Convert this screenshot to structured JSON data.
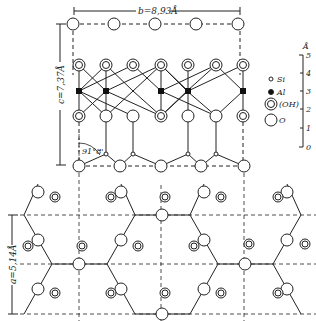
{
  "dimensions": {
    "b_label": "b=8,93Å",
    "c_label": "c=7,37Å",
    "a_label": "a=5,14Å",
    "angle_label": "91°8'"
  },
  "legend": {
    "items": [
      {
        "symbol": "small-open-circle",
        "label": "Si"
      },
      {
        "symbol": "filled-dot",
        "label": "Al"
      },
      {
        "symbol": "double-circle",
        "label": "(OH)"
      },
      {
        "symbol": "large-open-circle",
        "label": "O"
      }
    ]
  },
  "scale": {
    "unit": "Å",
    "ticks": [
      "5",
      "4",
      "3",
      "2",
      "1",
      "0"
    ]
  },
  "colors": {
    "ink": "#222222",
    "background": "#ffffff"
  }
}
